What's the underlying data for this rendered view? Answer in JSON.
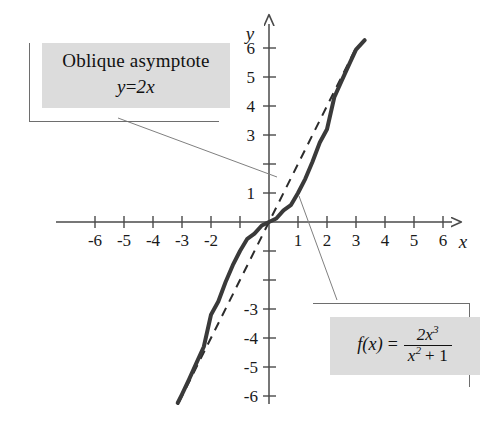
{
  "figure": {
    "kind": "cartesian-graph",
    "background": "#ffffff",
    "ink": "#2b2b2b"
  },
  "callouts": {
    "asymptote": {
      "name": "Oblique asymptote",
      "title": "Oblique asymptote",
      "equation_lhs": "y",
      "equation_rel": "=",
      "equation_rhs": "2x",
      "equation": "y = 2x",
      "fill": "#dcdcdc"
    },
    "formula": {
      "lhs": "f(x)",
      "rel": "=",
      "numerator": "2x",
      "numerator_exp": "3",
      "denominator_base": "x",
      "denominator_exp": "2",
      "denominator_tail": "+ 1",
      "denominator": "x² + 1",
      "full": "f(x) = 2x³/(x² + 1)",
      "fill": "#dcdcdc"
    }
  },
  "axes": {
    "x_label": "x",
    "y_label": "y",
    "x_ticks": [
      "-6",
      "-5",
      "-4",
      "-3",
      "-2",
      "-1",
      "1",
      "2",
      "3",
      "4",
      "5",
      "6"
    ],
    "x_tick_values": [
      -6,
      -5,
      -4,
      -3,
      -2,
      -1,
      1,
      2,
      3,
      4,
      5,
      6
    ],
    "x_tick_labels_shown": [
      "-6",
      "-5",
      "-4",
      "-3",
      "-2",
      "1",
      "2",
      "3",
      "4",
      "5",
      "6"
    ],
    "y_ticks": [
      "6",
      "5",
      "4",
      "3",
      "2",
      "1",
      "-1",
      "-2",
      "-3",
      "-4",
      "-5",
      "-6"
    ],
    "y_tick_values": [
      6,
      5,
      4,
      3,
      2,
      1,
      -1,
      -2,
      -3,
      -4,
      -5,
      -6
    ],
    "y_tick_labels_shown": [
      "6",
      "5",
      "4",
      "3",
      "1",
      "-3",
      "-4",
      "-5",
      "-6"
    ],
    "xlim": [
      -7.2,
      7.4
    ],
    "ylim": [
      -7.0,
      7.0
    ],
    "arrow_on_x_positive": true,
    "arrow_on_y_positive": true
  },
  "chart_data": {
    "type": "line",
    "title": "",
    "xlabel": "x",
    "ylabel": "y",
    "xlim": [
      -7.2,
      7.4
    ],
    "ylim": [
      -7.0,
      7.0
    ],
    "grid": false,
    "legend": "none",
    "annotations": [
      {
        "text": "Oblique asymptote y = 2x",
        "points_to": [
          2.05,
          1.35
        ]
      },
      {
        "text": "f(x) = 2x³/(x² + 1)",
        "points_to": [
          1.05,
          0.95
        ]
      }
    ],
    "series": [
      {
        "name": "f(x) = 2x^3/(x^2 + 1)",
        "style": "solid",
        "width": 4,
        "color": "#3a3a3a",
        "x": [
          -3.15,
          -3.0,
          -2.75,
          -2.5,
          -2.25,
          -2.0,
          -1.75,
          -1.5,
          -1.25,
          -1.0,
          -0.75,
          -0.5,
          -0.25,
          0.0,
          0.25,
          0.5,
          0.75,
          1.0,
          1.25,
          1.5,
          1.75,
          2.0,
          2.25,
          2.5,
          2.75,
          3.0,
          3.3
        ],
        "y": [
          -6.24,
          -5.94,
          -5.41,
          -4.86,
          -4.3,
          -3.2,
          -2.74,
          -2.08,
          -1.49,
          -1.0,
          -0.58,
          -0.4,
          -0.12,
          0.0,
          0.12,
          0.4,
          0.58,
          1.0,
          1.49,
          2.08,
          2.74,
          3.2,
          4.3,
          4.86,
          5.41,
          5.94,
          6.27
        ]
      },
      {
        "name": "y = 2x (oblique asymptote)",
        "style": "dashed",
        "width": 2,
        "color": "#2b2b2b",
        "x": [
          -3.1,
          3.05
        ],
        "y": [
          -6.2,
          6.1
        ]
      }
    ]
  }
}
